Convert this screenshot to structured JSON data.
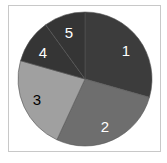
{
  "chart_data": {
    "type": "pie",
    "title": "",
    "categories": [
      "1",
      "2",
      "3",
      "4",
      "5"
    ],
    "values": [
      29.4,
      27.5,
      22.5,
      10.6,
      10.0
    ],
    "colors": [
      "#3c3c3c",
      "#6e6e6e",
      "#a0a0a0",
      "#353535",
      "#353535"
    ],
    "label_colors": [
      "#ffffff",
      "#ffffff",
      "#000000",
      "#ffffff",
      "#ffffff"
    ],
    "start_angle_deg": 0,
    "direction": "clockwise",
    "legend": "none",
    "center": [
      85,
      79
    ],
    "radius": 67,
    "slice_border_color": "#555555"
  },
  "labels": {
    "s1": "1",
    "s2": "2",
    "s3": "3",
    "s4": "4",
    "s5": "5"
  }
}
